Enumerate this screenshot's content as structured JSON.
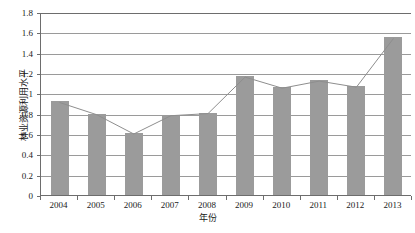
{
  "chart_data": {
    "type": "bar",
    "title": "",
    "subtitle": "",
    "xlabel": "年份",
    "ylabel": "林业资源利用水平",
    "categories": [
      "2004",
      "2005",
      "2006",
      "2007",
      "2008",
      "2009",
      "2010",
      "2011",
      "2012",
      "2013"
    ],
    "values": [
      0.92,
      0.8,
      0.61,
      0.79,
      0.81,
      1.17,
      1.06,
      1.13,
      1.07,
      1.55
    ],
    "series": [
      {
        "name": "林业资源利用水平",
        "type": "bar",
        "values": [
          0.92,
          0.8,
          0.61,
          0.79,
          0.81,
          1.17,
          1.06,
          1.13,
          1.07,
          1.55
        ]
      },
      {
        "name": "林业资源利用水平趋势线",
        "type": "line",
        "values": [
          0.92,
          0.8,
          0.61,
          0.79,
          0.81,
          1.17,
          1.06,
          1.13,
          1.07,
          1.55
        ]
      }
    ],
    "ylim": [
      0,
      1.8
    ],
    "ytick_labels": [
      "0",
      "0.2",
      "0.4",
      "0.6",
      "0.8",
      "1",
      "1.2",
      "1.4",
      "1.6",
      "1.8"
    ],
    "ytick_values": [
      0,
      0.2,
      0.4,
      0.6,
      0.8,
      1.0,
      1.2,
      1.4,
      1.6,
      1.8
    ],
    "grid": true,
    "grid_axis": "y",
    "legend": false,
    "legend_position": "none",
    "bar_color": "#9b9b9b",
    "line_color": "#8e8e8e",
    "axis_color": "#6d6d6d",
    "grid_color": "#9a9a9a",
    "background": "#ffffff",
    "annotations": []
  }
}
